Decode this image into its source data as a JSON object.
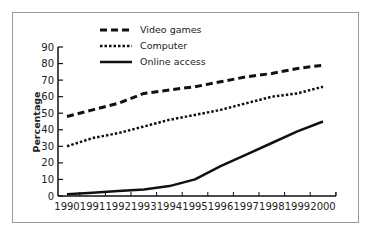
{
  "chart_data": {
    "type": "line",
    "title": "",
    "xlabel": "",
    "ylabel": "Percentage",
    "ylim": [
      0,
      90
    ],
    "yticks": [
      0,
      10,
      20,
      30,
      40,
      50,
      60,
      70,
      80,
      90
    ],
    "x": [
      1990,
      1991,
      1992,
      1993,
      1994,
      1995,
      1996,
      1997,
      1998,
      1999,
      2000
    ],
    "grid": false,
    "legend_position": "top-left inside",
    "series": [
      {
        "name": "Video games",
        "style": "dashed",
        "values": [
          48,
          52,
          56,
          62,
          64,
          66,
          69,
          72,
          74,
          77,
          79
        ]
      },
      {
        "name": "Computer",
        "style": "dotted",
        "values": [
          30,
          35,
          38,
          42,
          46,
          49,
          52,
          56,
          60,
          62,
          66
        ]
      },
      {
        "name": "Online access",
        "style": "solid",
        "values": [
          1,
          2,
          3,
          4,
          6,
          10,
          18,
          25,
          32,
          39,
          45
        ]
      }
    ]
  },
  "legend": {
    "items": [
      {
        "label": "Video games"
      },
      {
        "label": "Computer"
      },
      {
        "label": "Online access"
      }
    ]
  },
  "axis": {
    "ylabel": "Percentage",
    "y_ticks": [
      "0",
      "10",
      "20",
      "30",
      "40",
      "50",
      "60",
      "70",
      "80",
      "90"
    ],
    "x_ticks": [
      "1990",
      "1991",
      "1992",
      "1993",
      "1994",
      "1995",
      "1996",
      "1997",
      "1998",
      "1999",
      "2000"
    ]
  },
  "colors": {
    "line": "#111111",
    "frame": "#9a9a9a",
    "text": "#222222"
  }
}
